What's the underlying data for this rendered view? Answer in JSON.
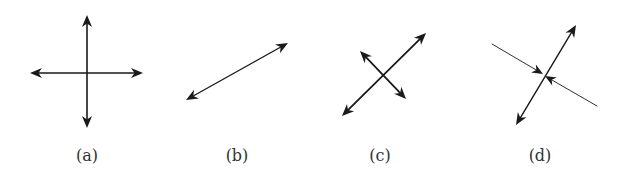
{
  "figure": {
    "background": "#ffffff",
    "stroke_color": "#1a1a1a",
    "panels": [
      {
        "id": "a",
        "label": "(a)",
        "label_x": 87,
        "description": "Two perpendicular double-headed arrows forming a cross",
        "lines": [
          {
            "x1": 87,
            "y1": 15,
            "x2": 87,
            "y2": 128,
            "width": 1.6,
            "arrow_start": true,
            "arrow_end": true
          },
          {
            "x1": 30,
            "y1": 73,
            "x2": 143,
            "y2": 73,
            "width": 1.6,
            "arrow_start": true,
            "arrow_end": true
          }
        ]
      },
      {
        "id": "b",
        "label": "(b)",
        "label_x": 237,
        "description": "Single diagonal double-headed arrow",
        "lines": [
          {
            "x1": 186,
            "y1": 100,
            "x2": 288,
            "y2": 43,
            "width": 1.4,
            "arrow_start": true,
            "arrow_end": true
          }
        ]
      },
      {
        "id": "c",
        "label": "(c)",
        "label_x": 380,
        "description": "Long diagonal double-headed arrow crossed by a shorter double-headed arrow",
        "lines": [
          {
            "x1": 342,
            "y1": 116,
            "x2": 426,
            "y2": 33,
            "width": 1.8,
            "arrow_start": true,
            "arrow_end": true
          },
          {
            "x1": 360,
            "y1": 51,
            "x2": 406,
            "y2": 99,
            "width": 1.8,
            "arrow_start": true,
            "arrow_end": true
          }
        ]
      },
      {
        "id": "d",
        "label": "(d)",
        "label_x": 540,
        "description": "Double-headed arrow crossed by a thin line with two inward-pointing arrows meeting at the intersection",
        "lines": [
          {
            "x1": 516,
            "y1": 125,
            "x2": 576,
            "y2": 25,
            "width": 1.4,
            "arrow_start": true,
            "arrow_end": true
          },
          {
            "x1": 492,
            "y1": 44,
            "x2": 543,
            "y2": 74,
            "width": 0.9,
            "arrow_start": false,
            "arrow_end": true
          },
          {
            "x1": 597,
            "y1": 106,
            "x2": 545,
            "y2": 76,
            "width": 0.9,
            "arrow_start": false,
            "arrow_end": true
          }
        ]
      }
    ]
  }
}
